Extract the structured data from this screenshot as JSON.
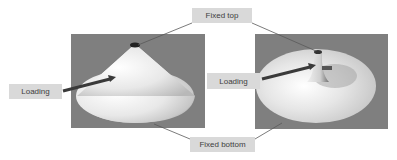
{
  "figure": {
    "labels": {
      "fixed_top": "Fixed top",
      "fixed_bottom": "Fixed bottom",
      "loading_left": "Loading",
      "loading_right": "Loading"
    },
    "panels": [
      {
        "name": "cone-undeformed",
        "background": "#7f7f7f"
      },
      {
        "name": "cone-deformed",
        "background": "#7f7f7f"
      }
    ],
    "colors": {
      "panel_bg": "#7f7f7f",
      "label_bg": "#d9d9d9",
      "label_text": "#404040",
      "arrow": "#3a3a3a",
      "leader_line": "#595959"
    }
  }
}
